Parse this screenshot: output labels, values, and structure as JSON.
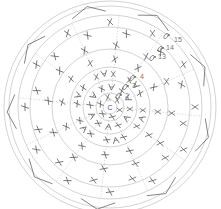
{
  "diagram": {
    "center_label": "C",
    "row_labels": [
      {
        "text": "2",
        "x": 125,
        "y": 98
      },
      {
        "text": "3",
        "x": 132,
        "y": 88
      },
      {
        "text": "4",
        "x": 140,
        "y": 79
      },
      {
        "text": "13",
        "x": 158,
        "y": 59
      },
      {
        "text": "14",
        "x": 166,
        "y": 50
      },
      {
        "text": "15",
        "x": 174,
        "y": 42
      }
    ],
    "colors": {
      "ring": "#c8c8c8",
      "stitch": "#555555",
      "dotted": "#bbbbbb",
      "edge": "#666666"
    },
    "center": {
      "x": 110,
      "y": 107
    },
    "rings": [
      7,
      14,
      27,
      40,
      58,
      80,
      92,
      101,
      106
    ],
    "stitch_symbols": [
      "sc-x",
      "increase-v",
      "chain-oval",
      "slip-stitch-dot"
    ]
  }
}
